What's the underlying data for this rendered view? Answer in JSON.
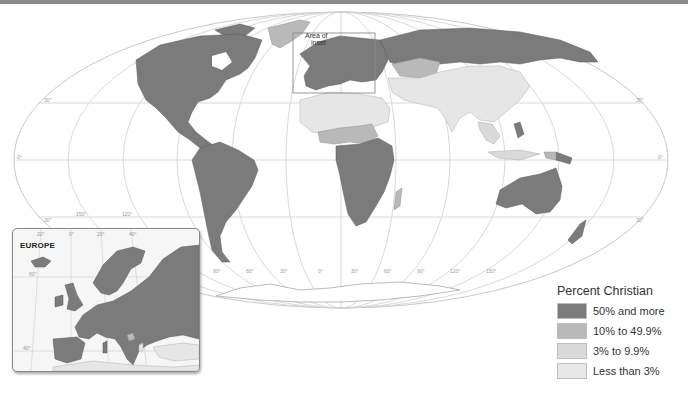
{
  "map": {
    "title": "Percent Christian",
    "projection": "Mollweide",
    "inset_marker_label": "Area of inset",
    "inset_marker_lines": [
      "Area of",
      "inset"
    ],
    "latitude_labels": [
      "30°",
      "0°",
      "30°"
    ],
    "longitude_labels": [
      "150°",
      "120°",
      "90°",
      "60°",
      "30°",
      "0°",
      "30°",
      "60°",
      "90°",
      "120°",
      "150°"
    ]
  },
  "inset": {
    "title": "EUROPE",
    "longitude_labels": [
      "20°",
      "0°",
      "20°",
      "40°"
    ],
    "latitude_labels": [
      "60°",
      "40°"
    ]
  },
  "legend": {
    "title": "Percent Christian",
    "items": [
      {
        "label": "50% and more",
        "color": "#7b7b7b"
      },
      {
        "label": "10% to 49.9%",
        "color": "#b9b9b9"
      },
      {
        "label": "3% to 9.9%",
        "color": "#dadada"
      },
      {
        "label": "Less than 3%",
        "color": "#e8e8e8"
      }
    ]
  }
}
